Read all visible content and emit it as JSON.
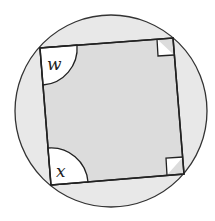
{
  "diagram": {
    "type": "cyclic-quadrilateral",
    "circle": {
      "cx": 111,
      "cy": 111,
      "r": 96,
      "fill": "#e8e8e8",
      "stroke": "#333333"
    },
    "quadrilateral": {
      "vertices": [
        [
          40,
          48
        ],
        [
          173,
          38
        ],
        [
          184,
          174
        ],
        [
          51,
          185
        ]
      ],
      "fill": "#dcdcdc",
      "stroke": "#222222"
    },
    "angles": [
      {
        "vertex": "top-left",
        "label": "w",
        "marker": "arc"
      },
      {
        "vertex": "top-right",
        "label": "",
        "marker": "right-angle"
      },
      {
        "vertex": "bottom-right",
        "label": "",
        "marker": "right-angle"
      },
      {
        "vertex": "bottom-left",
        "label": "x",
        "marker": "arc"
      }
    ]
  }
}
